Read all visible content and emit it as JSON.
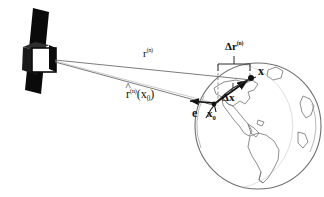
{
  "figure": {
    "type": "diagram",
    "background_color": "#ffffff",
    "line_color": "#5a5a5a",
    "ink_color": "#111111",
    "satellite_color": "#0a0a0a",
    "width": 324,
    "height": 197
  },
  "satellite": {
    "name": "satellite",
    "body_label": "p",
    "panel_label": "solar-panel",
    "body_face_label": "spacecraft-bus"
  },
  "earth": {
    "name": "earth-globe",
    "outline_color": "#6b6b6b",
    "continents": [
      "North America",
      "South America",
      "Greenland",
      "Africa"
    ]
  },
  "labels": {
    "range_vector": {
      "base": "r",
      "sup": "(n)",
      "full": "r(n)"
    },
    "unit_range_vector": {
      "base": "r",
      "hat": true,
      "sup": "(n)",
      "arg": "(x",
      "argsub": "0",
      "argclose": ")",
      "full": "r̂(n)(x0)"
    },
    "range_correction": {
      "base": "Δr",
      "sup": "(n)",
      "full": "Δr(n)"
    },
    "point_x": "x",
    "point_x0": {
      "base": "x",
      "sub": "0"
    },
    "delta_x": "Δx",
    "unit_vector_e": "e"
  },
  "annotations": {
    "measurement_bracket": "delta-r-bracket",
    "angle_marker": "angle-between-range-and-dx",
    "dashed_guide": "vertical-dashed-guide"
  }
}
